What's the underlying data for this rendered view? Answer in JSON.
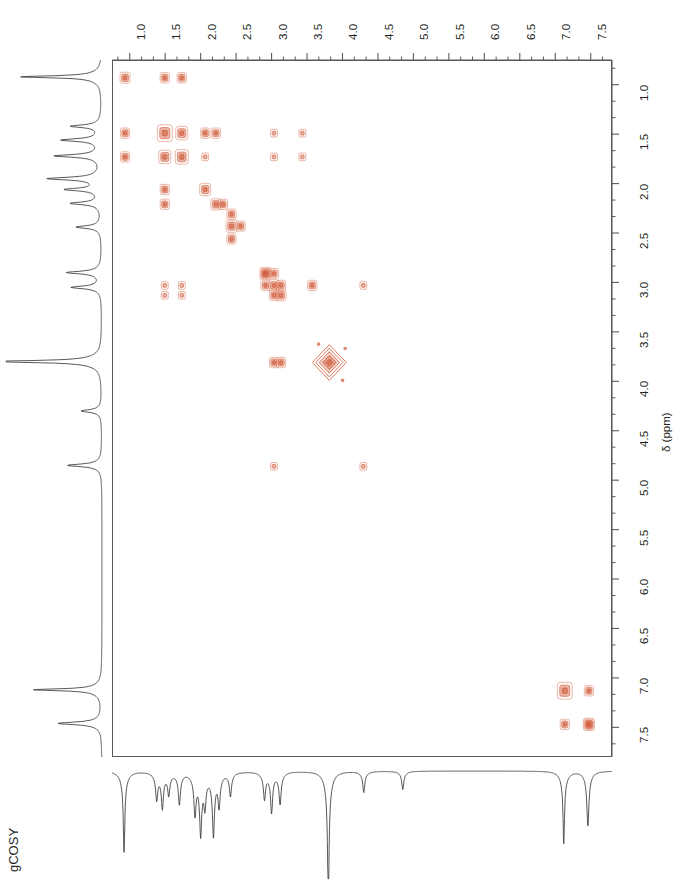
{
  "experiment": {
    "label": "gCOSY",
    "type": "2D homonuclear correlation (COSY)"
  },
  "axes": {
    "f2": {
      "title": "",
      "unit": "ppm",
      "orientation": "top",
      "direction": "left-to-right increasing",
      "ticks": [
        "1.0",
        "1.5",
        "2.0",
        "2.5",
        "3.0",
        "3.5",
        "4.0",
        "4.5",
        "5.0",
        "5.5",
        "6.0",
        "6.5",
        "7.0",
        "7.5"
      ],
      "range": [
        0.75,
        7.8
      ],
      "minor_ticks_per_major": 2
    },
    "f1": {
      "title": "δ (ppm)",
      "unit": "ppm",
      "orientation": "right",
      "direction": "top-to-bottom increasing",
      "ticks": [
        "1.0",
        "1.5",
        "2.0",
        "2.5",
        "3.0",
        "3.5",
        "4.0",
        "4.5",
        "5.0",
        "5.5",
        "6.0",
        "6.5",
        "7.0",
        "7.5"
      ],
      "range": [
        0.75,
        7.8
      ],
      "minor_ticks_per_major": 2
    }
  },
  "colors": {
    "contour": "#d2603f",
    "contour_light": "#e8a288",
    "trace": "#3a3a3a",
    "frame": "#5a5a5a",
    "text": "#231f20",
    "background": "#ffffff"
  },
  "chart_data": {
    "type": "scatter",
    "title": "gCOSY",
    "xlabel": "",
    "ylabel": "δ (ppm)",
    "xlim": [
      0.75,
      7.8
    ],
    "ylim": [
      0.75,
      7.8
    ],
    "grid": false,
    "legend": "none",
    "axis_note": "Both axes in ppm; F2 across top increasing left to right, F1 down right side increasing top to bottom",
    "diagonal_peaks": [
      {
        "ppm": 0.92,
        "intensity": "medium",
        "r": 5.0
      },
      {
        "ppm": 1.48,
        "intensity": "strong",
        "r": 7.5
      },
      {
        "ppm": 1.72,
        "intensity": "strong",
        "r": 6.5
      },
      {
        "ppm": 2.05,
        "intensity": "medium",
        "r": 5.5
      },
      {
        "ppm": 2.2,
        "intensity": "medium",
        "r": 5.0
      },
      {
        "ppm": 2.42,
        "intensity": "medium",
        "r": 5.5
      },
      {
        "ppm": 2.9,
        "intensity": "medium",
        "r": 5.5
      },
      {
        "ppm": 3.02,
        "intensity": "medium",
        "r": 5.0
      },
      {
        "ppm": 3.12,
        "intensity": "medium",
        "r": 5.0
      },
      {
        "ppm": 3.8,
        "intensity": "very strong",
        "r": 17.0
      },
      {
        "ppm": 7.12,
        "intensity": "strong",
        "r": 7.5
      },
      {
        "ppm": 7.46,
        "intensity": "medium",
        "r": 5.5
      }
    ],
    "cross_peaks": [
      {
        "f2": 0.92,
        "f1": 1.48,
        "intensity": "medium"
      },
      {
        "f2": 0.92,
        "f1": 1.72,
        "intensity": "medium"
      },
      {
        "f2": 1.48,
        "f1": 0.92,
        "intensity": "medium"
      },
      {
        "f2": 1.72,
        "f1": 0.92,
        "intensity": "medium"
      },
      {
        "f2": 1.48,
        "f1": 1.72,
        "intensity": "strong"
      },
      {
        "f2": 1.72,
        "f1": 1.48,
        "intensity": "strong"
      },
      {
        "f2": 2.05,
        "f1": 1.48,
        "intensity": "medium"
      },
      {
        "f2": 1.48,
        "f1": 2.05,
        "intensity": "medium"
      },
      {
        "f2": 2.05,
        "f1": 1.72,
        "intensity": "weak"
      },
      {
        "f2": 1.48,
        "f1": 2.2,
        "intensity": "medium"
      },
      {
        "f2": 2.2,
        "f1": 1.48,
        "intensity": "medium"
      },
      {
        "f2": 3.02,
        "f1": 1.48,
        "intensity": "weak"
      },
      {
        "f2": 3.02,
        "f1": 1.72,
        "intensity": "weak"
      },
      {
        "f2": 3.42,
        "f1": 1.48,
        "intensity": "weak"
      },
      {
        "f2": 3.42,
        "f1": 1.72,
        "intensity": "weak"
      },
      {
        "f2": 1.48,
        "f1": 3.02,
        "intensity": "weak"
      },
      {
        "f2": 1.72,
        "f1": 3.02,
        "intensity": "weak"
      },
      {
        "f2": 1.48,
        "f1": 3.12,
        "intensity": "weak"
      },
      {
        "f2": 1.72,
        "f1": 3.12,
        "intensity": "weak"
      },
      {
        "f2": 2.3,
        "f1": 2.2,
        "intensity": "medium"
      },
      {
        "f2": 2.42,
        "f1": 2.3,
        "intensity": "medium"
      },
      {
        "f2": 2.55,
        "f1": 2.42,
        "intensity": "medium"
      },
      {
        "f2": 2.42,
        "f1": 2.55,
        "intensity": "medium"
      },
      {
        "f2": 2.9,
        "f1": 2.9,
        "intensity": "medium"
      },
      {
        "f2": 3.02,
        "f1": 2.9,
        "intensity": "medium"
      },
      {
        "f2": 2.9,
        "f1": 3.02,
        "intensity": "medium"
      },
      {
        "f2": 3.12,
        "f1": 3.02,
        "intensity": "medium"
      },
      {
        "f2": 3.02,
        "f1": 3.12,
        "intensity": "medium"
      },
      {
        "f2": 3.56,
        "f1": 3.02,
        "intensity": "medium"
      },
      {
        "f2": 4.28,
        "f1": 3.02,
        "intensity": "weak"
      },
      {
        "f2": 3.02,
        "f1": 3.8,
        "intensity": "medium"
      },
      {
        "f2": 3.12,
        "f1": 3.8,
        "intensity": "medium"
      },
      {
        "f2": 3.02,
        "f1": 4.85,
        "intensity": "weak"
      },
      {
        "f2": 4.28,
        "f1": 4.85,
        "intensity": "weak"
      },
      {
        "f2": 7.12,
        "f1": 7.46,
        "intensity": "medium"
      },
      {
        "f2": 7.46,
        "f1": 7.12,
        "intensity": "medium"
      },
      {
        "f2": 7.46,
        "f1": 7.46,
        "intensity": "medium"
      }
    ],
    "f2_projection_peaks": [
      {
        "ppm": 0.92,
        "height": 0.62
      },
      {
        "ppm": 1.38,
        "height": 0.2
      },
      {
        "ppm": 1.46,
        "height": 0.26
      },
      {
        "ppm": 1.55,
        "height": 0.16
      },
      {
        "ppm": 1.7,
        "height": 0.24
      },
      {
        "ppm": 1.92,
        "height": 0.3
      },
      {
        "ppm": 2.0,
        "height": 0.44
      },
      {
        "ppm": 2.06,
        "height": 0.22
      },
      {
        "ppm": 2.18,
        "height": 0.46
      },
      {
        "ppm": 2.26,
        "height": 0.24
      },
      {
        "ppm": 2.42,
        "height": 0.18
      },
      {
        "ppm": 2.9,
        "height": 0.2
      },
      {
        "ppm": 3.0,
        "height": 0.3
      },
      {
        "ppm": 3.12,
        "height": 0.24
      },
      {
        "ppm": 3.8,
        "height": 1.0
      },
      {
        "ppm": 4.3,
        "height": 0.16
      },
      {
        "ppm": 4.85,
        "height": 0.14
      },
      {
        "ppm": 7.12,
        "height": 0.55
      },
      {
        "ppm": 7.46,
        "height": 0.42
      }
    ],
    "f1_projection_peaks": [
      {
        "ppm": 0.92,
        "height": 0.72
      },
      {
        "ppm": 1.42,
        "height": 0.26
      },
      {
        "ppm": 1.56,
        "height": 0.34
      },
      {
        "ppm": 1.72,
        "height": 0.4
      },
      {
        "ppm": 1.95,
        "height": 0.46
      },
      {
        "ppm": 2.06,
        "height": 0.3
      },
      {
        "ppm": 2.2,
        "height": 0.26
      },
      {
        "ppm": 2.44,
        "height": 0.22
      },
      {
        "ppm": 2.9,
        "height": 0.3
      },
      {
        "ppm": 3.05,
        "height": 0.26
      },
      {
        "ppm": 3.8,
        "height": 1.0
      },
      {
        "ppm": 4.3,
        "height": 0.18
      },
      {
        "ppm": 4.85,
        "height": 0.3
      },
      {
        "ppm": 7.12,
        "height": 0.6
      },
      {
        "ppm": 7.46,
        "height": 0.38
      }
    ]
  }
}
